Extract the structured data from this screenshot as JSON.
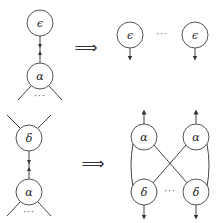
{
  "rules": [
    {
      "name": "epsilon-alpha-rule",
      "lhs": {
        "top_node": "ϵ",
        "bottom_node": "α",
        "bottom_dots": "···"
      },
      "arrow": "⟹",
      "rhs": {
        "nodes": [
          "ϵ",
          "ϵ"
        ],
        "between": "···"
      }
    },
    {
      "name": "delta-alpha-rule",
      "lhs": {
        "top_node": "δ",
        "bottom_node": "α",
        "bottom_dots": "···"
      },
      "arrow": "⟹",
      "rhs": {
        "top_nodes": [
          "α",
          "α"
        ],
        "bottom_nodes": [
          "δ",
          "δ"
        ],
        "between": "···"
      }
    }
  ],
  "colors": {
    "stroke": "#555555",
    "text": "#222222",
    "background": "#ffffff"
  }
}
